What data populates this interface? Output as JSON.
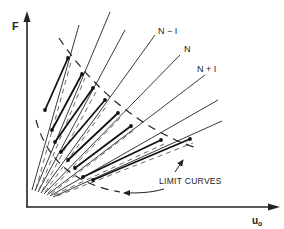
{
  "diagram": {
    "y_axis_label": "F",
    "x_axis_label": "u₀",
    "x_axis_label_main": "u",
    "x_axis_label_sub": "o",
    "line_labels": [
      "N − I",
      "N",
      "N + I"
    ],
    "annotation": "LIMIT CURVES",
    "fan_line_count": 7,
    "colors": {
      "ink": "#222222",
      "background": "#ffffff"
    }
  }
}
